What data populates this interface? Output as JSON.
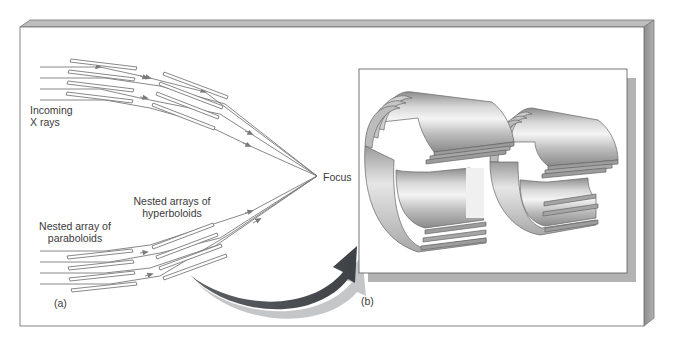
{
  "figure": {
    "panel_a": {
      "tag": "(a)",
      "labels": {
        "incoming_line1": "Incoming",
        "incoming_line2": "X rays",
        "hyperboloids_line1": "Nested arrays of",
        "hyperboloids_line2": "hyperboloids",
        "paraboloids_line1": "Nested array of",
        "paraboloids_line2": "paraboloids",
        "focus": "Focus"
      }
    },
    "panel_b": {
      "tag": "(b)"
    }
  },
  "colors": {
    "frame_side": "#9a9a9a",
    "frame_top": "#b5b5b5",
    "ray": "#7a7a7a",
    "curved_arrow": "#55585c",
    "panel_shadow": "#b0b0b0"
  }
}
